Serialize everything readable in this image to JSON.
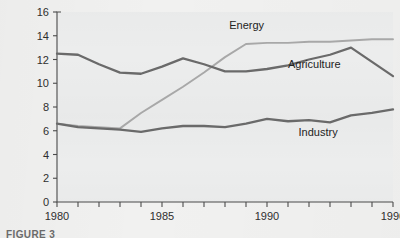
{
  "figure": {
    "caption_partial": "FIGURE 3"
  },
  "axes": {
    "y_title": "Million metric tons carbon equivalent",
    "y_ticks": [
      "0",
      "2",
      "4",
      "6",
      "8",
      "10",
      "12",
      "14",
      "16"
    ],
    "x_ticks_labeled": [
      "1980",
      "1985",
      "1990",
      "1996"
    ]
  },
  "series_labels": {
    "energy": "Energy",
    "agriculture": "Agriculture",
    "industry": "Industry"
  },
  "colors": {
    "energy": "#a8a8a8",
    "agriculture": "#6a6a6a",
    "industry": "#6a6a6a",
    "axis": "#4b4b4b",
    "plot_background": "#eceded",
    "page_background": "#f1f1f0"
  },
  "chart_data": {
    "type": "line",
    "title": "",
    "xlabel": "",
    "ylabel": "Million metric tons carbon equivalent",
    "xlim": [
      1980,
      1996
    ],
    "ylim": [
      0,
      16
    ],
    "y_tick_values": [
      0,
      2,
      4,
      6,
      8,
      10,
      12,
      14,
      16
    ],
    "x_tick_values": [
      1980,
      1981,
      1982,
      1983,
      1984,
      1985,
      1986,
      1987,
      1988,
      1989,
      1990,
      1991,
      1992,
      1993,
      1994,
      1995,
      1996
    ],
    "x_tick_labels_shown": [
      1980,
      1985,
      1990,
      1996
    ],
    "grid": false,
    "legend": "inline-labels",
    "x": [
      1980,
      1981,
      1982,
      1983,
      1984,
      1985,
      1986,
      1987,
      1988,
      1989,
      1990,
      1991,
      1992,
      1993,
      1994,
      1995,
      1996
    ],
    "series": [
      {
        "name": "Energy",
        "color": "#a8a8a8",
        "label_position": "above-line",
        "values": [
          6.6,
          6.4,
          6.3,
          6.2,
          7.5,
          8.6,
          9.7,
          10.9,
          12.2,
          13.3,
          13.4,
          13.4,
          13.5,
          13.5,
          13.6,
          13.7,
          13.7
        ]
      },
      {
        "name": "Agriculture",
        "color": "#6a6a6a",
        "label_position": "below-line",
        "values": [
          12.5,
          12.4,
          11.6,
          10.9,
          10.8,
          11.4,
          12.1,
          11.6,
          11.0,
          11.0,
          11.2,
          11.5,
          12.0,
          12.4,
          13.0,
          11.8,
          10.6
        ]
      },
      {
        "name": "Industry",
        "color": "#6a6a6a",
        "label_position": "below-line",
        "values": [
          6.6,
          6.3,
          6.2,
          6.1,
          5.9,
          6.2,
          6.4,
          6.4,
          6.3,
          6.6,
          7.0,
          6.8,
          6.9,
          6.7,
          7.3,
          7.5,
          7.8
        ]
      }
    ],
    "annotations": [
      {
        "text": "Energy",
        "x": 1988.2,
        "y": 14.6
      },
      {
        "text": "Agriculture",
        "x": 1991.0,
        "y": 11.3
      },
      {
        "text": "Industry",
        "x": 1991.5,
        "y": 5.6
      }
    ]
  }
}
